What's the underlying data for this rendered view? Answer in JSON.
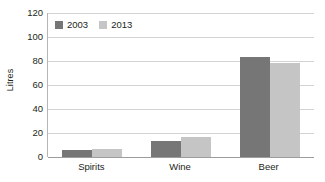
{
  "chart_data": {
    "type": "bar",
    "title": "",
    "subtitle": "",
    "xlabel": "",
    "ylabel": "Litres",
    "categories": [
      "Spirits",
      "Wine",
      "Beer"
    ],
    "series": [
      {
        "name": "2003",
        "color": "#767676",
        "values": [
          6,
          13,
          83
        ]
      },
      {
        "name": "2013",
        "color": "#c5c5c5",
        "values": [
          6.5,
          17,
          78
        ]
      }
    ],
    "ylim": [
      0,
      120
    ],
    "ytick_values": [
      0,
      20,
      40,
      60,
      80,
      100,
      120
    ],
    "ytick_labels": [
      "0",
      "20",
      "40",
      "60",
      "80",
      "100",
      "120"
    ],
    "grid": {
      "horizontal": true,
      "vertical": false,
      "color": "#d3d3d3"
    },
    "legend": {
      "position": "top-left-inside",
      "orientation": "horizontal"
    },
    "axis_colors": {
      "axis_line": "#b5b5b5",
      "baseline": "#9d9d9d"
    },
    "background": "#ffffff"
  }
}
